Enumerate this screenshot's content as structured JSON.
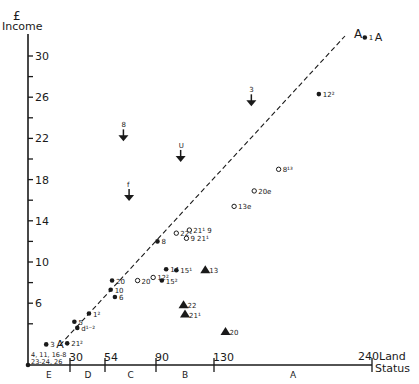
{
  "chart_data": {
    "type": "scatter",
    "title": "",
    "xlabel": "Land Status",
    "ylabel": "Income",
    "ylabel_unit": "£",
    "xlim": [
      0,
      240
    ],
    "ylim": [
      0,
      32
    ],
    "x_ticks": [
      30,
      54,
      90,
      130,
      240
    ],
    "y_ticks": [
      6,
      10,
      14,
      18,
      22,
      26,
      30
    ],
    "y_minor_ticks": [
      4,
      8,
      12,
      16,
      20,
      24,
      28
    ],
    "x_zones": [
      {
        "label": "E",
        "from": 0,
        "to": 30
      },
      {
        "label": "D",
        "from": 30,
        "to": 54
      },
      {
        "label": "C",
        "from": 54,
        "to": 90
      },
      {
        "label": "B",
        "from": 90,
        "to": 130
      },
      {
        "label": "A",
        "from": 130,
        "to": 240
      }
    ],
    "trend_line": {
      "label": "A",
      "style": "dashed",
      "from": [
        27,
        3
      ],
      "to": [
        240,
        32
      ]
    },
    "series": [
      {
        "name": "filled circles",
        "marker": "dot",
        "points": [
          {
            "label": "1",
            "suffix": "A",
            "x": 235,
            "y": 31.8
          },
          {
            "label": "12²",
            "x": 203,
            "y": 26.3
          },
          {
            "label": "8",
            "x": 91,
            "y": 12
          },
          {
            "label": "14",
            "x": 97,
            "y": 9.3
          },
          {
            "label": "15¹",
            "x": 104,
            "y": 9.2
          },
          {
            "label": "15²",
            "x": 94,
            "y": 8.2
          },
          {
            "label": "20",
            "x": 59,
            "y": 8.2
          },
          {
            "label": "10",
            "x": 58,
            "y": 7.3
          },
          {
            "label": "6",
            "x": 61,
            "y": 6.6
          },
          {
            "label": "1²",
            "x": 43,
            "y": 5
          },
          {
            "label": "5",
            "x": 33,
            "y": 4.2
          },
          {
            "label": "d¹⁻²",
            "x": 35,
            "y": 3.6
          },
          {
            "label": "21²",
            "x": 28,
            "y": 2.1
          },
          {
            "label": "3",
            "suffix": "A",
            "x": 13,
            "y": 2
          },
          {
            "label": "4, 11, 16-8 / 23-24, 26",
            "x": 0,
            "y": 0
          }
        ]
      },
      {
        "name": "open circles",
        "marker": "circle",
        "points": [
          {
            "label": "8¹³",
            "x": 175,
            "y": 19
          },
          {
            "label": "20e",
            "x": 158,
            "y": 16.9
          },
          {
            "label": "13e",
            "x": 144,
            "y": 15.4
          },
          {
            "label": "22¹",
            "x": 104,
            "y": 12.8
          },
          {
            "label": "21¹ 9",
            "x": 113,
            "y": 13.1
          },
          {
            "label": "9 21¹",
            "x": 111,
            "y": 12.3
          },
          {
            "label": "12²",
            "x": 88,
            "y": 8.5
          },
          {
            "label": "20",
            "x": 77,
            "y": 8.2
          }
        ]
      },
      {
        "name": "arrows",
        "marker": "arrow-down",
        "points": [
          {
            "label": "3",
            "x": 156,
            "y": 25.6
          },
          {
            "label": "8",
            "x": 67,
            "y": 22.2
          },
          {
            "label": "U",
            "x": 107,
            "y": 20.2
          },
          {
            "label": "f",
            "x": 71,
            "y": 16.4
          }
        ]
      },
      {
        "name": "triangles",
        "marker": "triangle",
        "points": [
          {
            "label": "13",
            "x": 124,
            "y": 9.2
          },
          {
            "label": "22",
            "x": 109,
            "y": 5.8
          },
          {
            "label": "21¹",
            "x": 110,
            "y": 4.9
          },
          {
            "label": "20",
            "x": 138,
            "y": 3.2
          }
        ]
      }
    ]
  },
  "axes": {
    "y_unit": "£",
    "y_title": "Income",
    "x_title_line1": "Land",
    "x_title_line2": "Status",
    "x_end_label": "240",
    "trend_label": "A",
    "origin_label_line1": "4, 11, 16-8",
    "origin_label_line2": "23-24, 26"
  }
}
